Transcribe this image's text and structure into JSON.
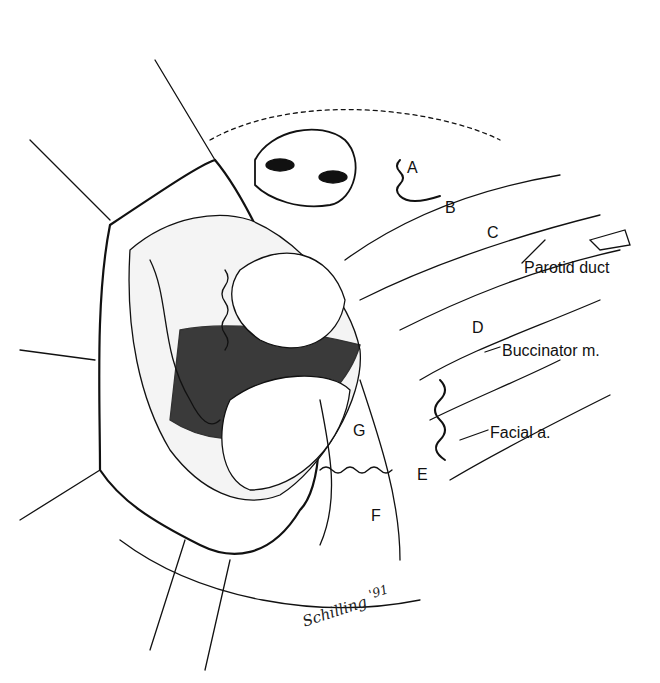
{
  "figure": {
    "type": "anatomical line illustration",
    "labels": [
      {
        "id": "A",
        "text": "A",
        "x": 407,
        "y": 160
      },
      {
        "id": "B",
        "text": "B",
        "x": 445,
        "y": 200
      },
      {
        "id": "C",
        "text": "C",
        "x": 487,
        "y": 225
      },
      {
        "id": "D",
        "text": "D",
        "x": 472,
        "y": 320
      },
      {
        "id": "E",
        "text": "E",
        "x": 417,
        "y": 467
      },
      {
        "id": "F",
        "text": "F",
        "x": 371,
        "y": 508
      },
      {
        "id": "G",
        "text": "G",
        "x": 353,
        "y": 423
      },
      {
        "id": "parotid_duct",
        "text": "Parotid duct",
        "x": 524,
        "y": 260
      },
      {
        "id": "buccinator",
        "text": "Buccinator m.",
        "x": 502,
        "y": 343
      },
      {
        "id": "facial_artery",
        "text": "Facial a.",
        "x": 490,
        "y": 425
      }
    ],
    "signature": {
      "name": "Schilling",
      "year": "'91"
    }
  },
  "colors": {
    "ink": "#111111",
    "background": "#ffffff",
    "shadow": "#1a1a1a"
  }
}
